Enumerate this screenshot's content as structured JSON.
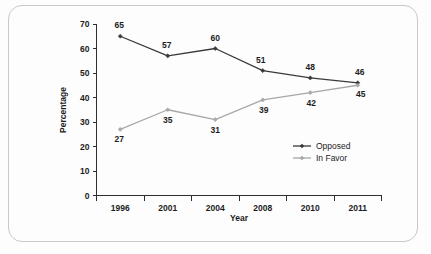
{
  "chart_data": {
    "type": "line",
    "title": "",
    "xlabel": "Year",
    "ylabel": "Percentage",
    "categories": [
      "1996",
      "2001",
      "2004",
      "2008",
      "2010",
      "2011"
    ],
    "series": [
      {
        "name": "Opposed",
        "color": "#3a3a3a",
        "values": [
          65,
          57,
          60,
          51,
          48,
          46
        ],
        "labels": [
          "65",
          "57",
          "60",
          "51",
          "48",
          "46"
        ]
      },
      {
        "name": "In Favor",
        "color": "#a8a8a8",
        "values": [
          27,
          35,
          31,
          39,
          42,
          45
        ],
        "labels": [
          "27",
          "35",
          "31",
          "39",
          "42",
          "45"
        ]
      }
    ],
    "ylim": [
      0,
      70
    ],
    "ytick_values": [
      0,
      10,
      20,
      30,
      40,
      50,
      60,
      70
    ],
    "ytick_labels": [
      "0",
      "10",
      "20",
      "30",
      "40",
      "50",
      "60",
      "70"
    ],
    "grid": false,
    "legend_position": "center-right",
    "marker": "diamond"
  },
  "legend": {
    "entries": [
      {
        "label": "Opposed",
        "color": "#3a3a3a"
      },
      {
        "label": "In Favor",
        "color": "#a8a8a8"
      }
    ]
  },
  "frame": {
    "border_color": "#c9c9cc",
    "background": "#fdfdfd"
  }
}
